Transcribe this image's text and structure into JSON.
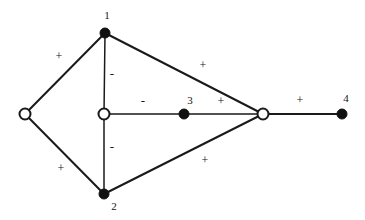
{
  "figure": {
    "background_color": "#ffffff",
    "ink_color": "#161616",
    "width": 365,
    "height": 220
  },
  "graph_data": {
    "type": "node-link-diagram",
    "node_marker_legend": {
      "filled": "solid black disc",
      "hollow": "white disc with black outline"
    },
    "nodes": [
      {
        "id": "v_left",
        "label": "",
        "style": "hollow",
        "x": 25,
        "y": 114,
        "r": 5.5
      },
      {
        "id": "v1",
        "label": "1",
        "style": "filled",
        "x": 105,
        "y": 33,
        "r": 5.0,
        "label_x": 107,
        "label_y": 19
      },
      {
        "id": "v_center",
        "label": "",
        "style": "hollow",
        "x": 104,
        "y": 114,
        "r": 5.5
      },
      {
        "id": "v2",
        "label": "2",
        "style": "filled",
        "x": 104,
        "y": 194,
        "r": 5.0,
        "label_x": 114,
        "label_y": 210
      },
      {
        "id": "v3",
        "label": "3",
        "style": "filled",
        "x": 184,
        "y": 114,
        "r": 5.0,
        "label_x": 190,
        "label_y": 104
      },
      {
        "id": "v_right",
        "label": "",
        "style": "hollow",
        "x": 263,
        "y": 114,
        "r": 5.5
      },
      {
        "id": "v4",
        "label": "4",
        "style": "filled",
        "x": 342,
        "y": 114,
        "r": 5.0,
        "label_x": 346,
        "label_y": 102
      }
    ],
    "edges": [
      {
        "id": "e_left_1",
        "source": "v_left",
        "target": "v1",
        "sign": "+",
        "label_x": 59,
        "label_y": 57,
        "width": 2.0
      },
      {
        "id": "e_left_2",
        "source": "v_left",
        "target": "v2",
        "sign": "+",
        "label_x": 61,
        "label_y": 169,
        "width": 2.0
      },
      {
        "id": "e_1_center",
        "source": "v1",
        "target": "v_center",
        "sign": "-",
        "label_x": 112,
        "label_y": 75,
        "width": 1.5
      },
      {
        "id": "e_center_2",
        "source": "v_center",
        "target": "v2",
        "sign": "-",
        "label_x": 112,
        "label_y": 148,
        "width": 1.5
      },
      {
        "id": "e_center_3",
        "source": "v_center",
        "target": "v3",
        "sign": "-",
        "label_x": 143,
        "label_y": 102,
        "width": 1.5
      },
      {
        "id": "e_3_right",
        "source": "v3",
        "target": "v_right",
        "sign": "+",
        "label_x": 221,
        "label_y": 102,
        "width": 1.5
      },
      {
        "id": "e_1_right",
        "source": "v1",
        "target": "v_right",
        "sign": "+",
        "label_x": 203,
        "label_y": 66,
        "width": 2.0
      },
      {
        "id": "e_2_right",
        "source": "v2",
        "target": "v_right",
        "sign": "+",
        "label_x": 205,
        "label_y": 161,
        "width": 2.0
      },
      {
        "id": "e_right_4",
        "source": "v_right",
        "target": "v4",
        "sign": "+",
        "label_x": 300,
        "label_y": 101,
        "width": 2.0
      }
    ],
    "node_labels": [
      "1",
      "2",
      "3",
      "4"
    ],
    "edge_signs": [
      "+",
      "+",
      "-",
      "-",
      "-",
      "+",
      "+",
      "+",
      "+"
    ],
    "counts": {
      "nodes": 7,
      "labeled_nodes": 4,
      "unlabeled_nodes": 3,
      "edges": 9,
      "positive_edges": 6,
      "negative_edges": 3
    }
  }
}
